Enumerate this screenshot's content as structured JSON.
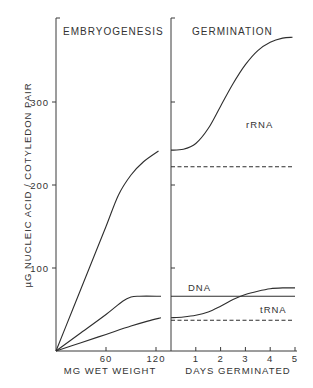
{
  "chart_data": [
    {
      "type": "line",
      "title": "EMBRYOGENESIS",
      "xlabel": "MG WET WEIGHT",
      "ylabel": "µG NUCLEIC ACID / COTYLEDON PAIR",
      "xlim": [
        0,
        130
      ],
      "ylim": [
        0,
        390
      ],
      "xticks": [
        60,
        120
      ],
      "yticks": [
        100,
        200,
        300
      ],
      "ytick_labels": [
        "100",
        "200",
        "300"
      ],
      "xtick_labels": [
        "60",
        "120"
      ],
      "grid": false,
      "series": [
        {
          "name": "rRNA (embryo)",
          "style": "solid",
          "x": [
            0,
            20,
            40,
            60,
            75,
            90,
            105,
            123
          ],
          "y": [
            0,
            50,
            100,
            150,
            188,
            212,
            228,
            241
          ]
        },
        {
          "name": "DNA (embryo)",
          "style": "solid",
          "x": [
            0,
            30,
            60,
            80,
            90,
            100,
            126
          ],
          "y": [
            0,
            22,
            44,
            60,
            65,
            66,
            66
          ]
        },
        {
          "name": "tRNA (embryo)",
          "style": "solid",
          "x": [
            0,
            30,
            60,
            90,
            110,
            126
          ],
          "y": [
            0,
            10,
            20,
            30,
            36,
            40
          ]
        }
      ]
    },
    {
      "type": "line",
      "title": "GERMINATION",
      "xlabel": "DAYS GERMINATED",
      "ylabel": "",
      "xlim": [
        0,
        5
      ],
      "ylim": [
        0,
        390
      ],
      "xticks": [
        1,
        2,
        3,
        4,
        5
      ],
      "xtick_labels": [
        "1",
        "2",
        "3",
        "4",
        "5"
      ],
      "yticks": [
        100,
        200,
        300
      ],
      "grid": false,
      "series": [
        {
          "name": "rRNA",
          "label": "rRNA",
          "style": "solid",
          "x": [
            0,
            0.5,
            1,
            1.5,
            2,
            2.5,
            3,
            3.5,
            4,
            4.5,
            4.9
          ],
          "y": [
            242,
            243,
            250,
            268,
            295,
            322,
            345,
            362,
            372,
            377,
            378
          ]
        },
        {
          "name": "rRNA baseline",
          "style": "dashed",
          "x": [
            0,
            4.9
          ],
          "y": [
            222,
            222
          ]
        },
        {
          "name": "DNA",
          "label": "DNA",
          "style": "solid",
          "x": [
            0,
            5
          ],
          "y": [
            66,
            66
          ]
        },
        {
          "name": "tRNA",
          "label": "tRNA",
          "style": "solid",
          "x": [
            0,
            0.5,
            1,
            1.5,
            2,
            2.5,
            3,
            3.5,
            4,
            4.5,
            5
          ],
          "y": [
            40,
            41,
            43,
            47,
            54,
            62,
            68,
            72,
            75,
            76,
            76
          ]
        },
        {
          "name": "tRNA baseline",
          "style": "dashed",
          "x": [
            0,
            4.9
          ],
          "y": [
            37,
            37
          ]
        }
      ]
    }
  ],
  "labels": {
    "left_title": "EMBRYOGENESIS",
    "right_title": "GERMINATION",
    "ylabel": "µG NUCLEIC ACID / COTYLEDON PAIR",
    "left_xlabel": "MG WET WEIGHT",
    "right_xlabel": "DAYS GERMINATED",
    "rrna": "rRNA",
    "dna": "DNA",
    "trna": "tRNA"
  }
}
